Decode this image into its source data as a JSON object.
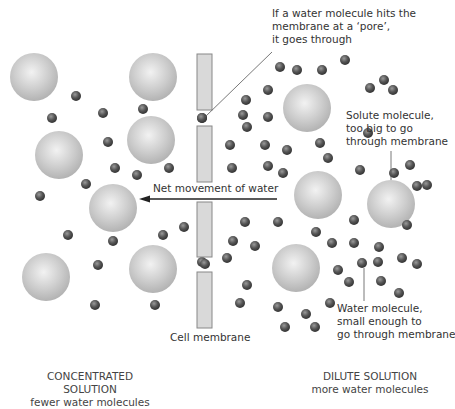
{
  "annotations": {
    "pore": [
      "If a water molecule hits the",
      "membrane at a ‘pore’,",
      "it goes through"
    ],
    "solute": [
      "Solute molecule,",
      "too big to go",
      "through membrane"
    ],
    "water": [
      "Water molecule,",
      "small enough to",
      "go through membrane"
    ],
    "net_movement": "Net movement of water",
    "membrane": "Cell membrane"
  },
  "left_side": {
    "title": "CONCENTRATED SOLUTION",
    "subtitle": "fewer water molecules"
  },
  "right_side": {
    "title": "DILUTE SOLUTION",
    "subtitle": "more water molecules"
  },
  "colors": {
    "membrane_fill": "#d9d9d9",
    "membrane_stroke": "#888888",
    "solute": "#c8c8c8",
    "water": "#555555",
    "text": "#333333"
  },
  "solutes": [
    [
      34,
      77
    ],
    [
      153,
      77
    ],
    [
      59,
      155
    ],
    [
      151,
      140
    ],
    [
      113,
      208
    ],
    [
      46,
      277
    ],
    [
      153,
      269
    ],
    [
      307,
      108
    ],
    [
      318,
      195
    ],
    [
      391,
      204
    ],
    [
      296,
      268
    ]
  ],
  "waters": [
    [
      76,
      96
    ],
    [
      103,
      113
    ],
    [
      143,
      109
    ],
    [
      52,
      118
    ],
    [
      108,
      142
    ],
    [
      115,
      168
    ],
    [
      137,
      175
    ],
    [
      86,
      184
    ],
    [
      169,
      168
    ],
    [
      40,
      196
    ],
    [
      68,
      235
    ],
    [
      113,
      241
    ],
    [
      163,
      235
    ],
    [
      184,
      227
    ],
    [
      98,
      265
    ],
    [
      95,
      305
    ],
    [
      155,
      305
    ],
    [
      202,
      118
    ],
    [
      202,
      262
    ],
    [
      280,
      67
    ],
    [
      297,
      70
    ],
    [
      322,
      70
    ],
    [
      345,
      60
    ],
    [
      370,
      88
    ],
    [
      384,
      80
    ],
    [
      393,
      90
    ],
    [
      246,
      100
    ],
    [
      268,
      90
    ],
    [
      243,
      115
    ],
    [
      268,
      117
    ],
    [
      247,
      127
    ],
    [
      230,
      145
    ],
    [
      265,
      145
    ],
    [
      287,
      150
    ],
    [
      320,
      143
    ],
    [
      328,
      158
    ],
    [
      368,
      133
    ],
    [
      232,
      168
    ],
    [
      268,
      166
    ],
    [
      283,
      173
    ],
    [
      360,
      170
    ],
    [
      394,
      173
    ],
    [
      417,
      186
    ],
    [
      410,
      165
    ],
    [
      427,
      185
    ],
    [
      245,
      222
    ],
    [
      233,
      241
    ],
    [
      255,
      246
    ],
    [
      227,
      258
    ],
    [
      278,
      222
    ],
    [
      316,
      232
    ],
    [
      332,
      243
    ],
    [
      338,
      270
    ],
    [
      354,
      220
    ],
    [
      354,
      243
    ],
    [
      379,
      247
    ],
    [
      407,
      225
    ],
    [
      417,
      264
    ],
    [
      402,
      258
    ],
    [
      378,
      262
    ],
    [
      362,
      263
    ],
    [
      247,
      285
    ],
    [
      240,
      303
    ],
    [
      278,
      307
    ],
    [
      306,
      314
    ],
    [
      330,
      303
    ],
    [
      285,
      327
    ],
    [
      315,
      327
    ],
    [
      349,
      282
    ],
    [
      381,
      281
    ],
    [
      399,
      293
    ]
  ]
}
